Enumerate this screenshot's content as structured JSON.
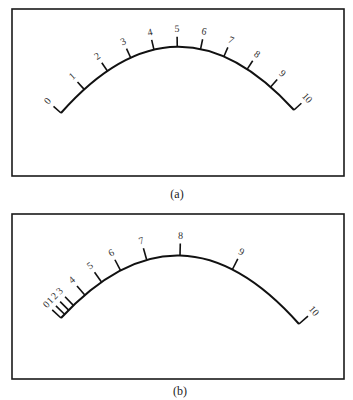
{
  "figure": {
    "panels": [
      {
        "id": "a",
        "caption": "(a)",
        "scale_type": "linear",
        "labels": [
          "0",
          "1",
          "2",
          "3",
          "4",
          "5",
          "6",
          "7",
          "8",
          "9",
          "10"
        ]
      },
      {
        "id": "b",
        "caption": "(b)",
        "scale_type": "nonlinear",
        "labels": [
          "0",
          "1",
          "2",
          "3",
          "4",
          "5",
          "6",
          "7",
          "8",
          "9",
          "10"
        ]
      }
    ]
  }
}
